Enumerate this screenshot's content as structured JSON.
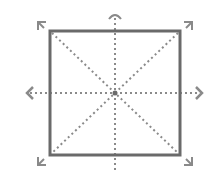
{
  "diagram": {
    "colors": {
      "background": "#ffffff",
      "box_stroke": "#6a6a6a",
      "dash_stroke": "#8a8a8a",
      "handle_stroke": "#8a8a8a"
    },
    "box": {
      "x": 50,
      "y": 31,
      "width": 130,
      "height": 124
    },
    "center": {
      "x": 115,
      "y": 93
    },
    "handles": [
      {
        "name": "rotate-handle",
        "position": "top"
      },
      {
        "name": "resize-handle-nw",
        "position": "top-left"
      },
      {
        "name": "resize-handle-ne",
        "position": "top-right"
      },
      {
        "name": "resize-handle-sw",
        "position": "bottom-left"
      },
      {
        "name": "resize-handle-se",
        "position": "bottom-right"
      },
      {
        "name": "move-handle-left",
        "position": "left"
      },
      {
        "name": "move-handle-right",
        "position": "right"
      }
    ]
  }
}
